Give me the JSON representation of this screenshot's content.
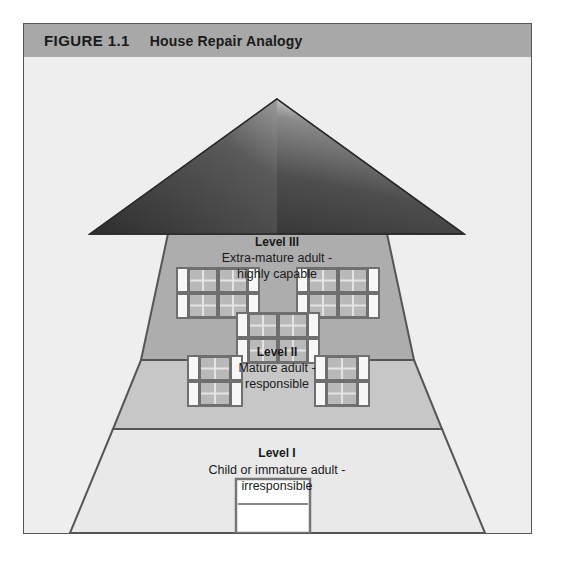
{
  "figure": {
    "number": "FIGURE 1.1",
    "title": "House Repair Analogy"
  },
  "diagram": {
    "name": "house-diagram",
    "levels": [
      {
        "id": "level-3",
        "title": "Level III",
        "desc_line1": "Extra-mature adult -",
        "desc_line2": "highly capable",
        "fill": "#a9a9a9"
      },
      {
        "id": "level-2",
        "title": "Level II",
        "desc_line1": "Mature adult -",
        "desc_line2": "responsible",
        "fill": "#c3c3c3"
      },
      {
        "id": "level-1",
        "title": "Level I",
        "desc_line1": "Child or immature adult -",
        "desc_line2": "irresponsible",
        "fill": "#e6e6e6"
      }
    ],
    "roof": {
      "name": "roof",
      "fill_light": "#8f8f8f",
      "fill_dark": "#2f2f2f"
    },
    "door": {
      "name": "front-door",
      "fill": "#ffffff"
    }
  },
  "colors": {
    "panel_bg": "#eeeeee",
    "header_bg": "#a8a8a8",
    "outline": "#555555",
    "window_frame": "#6f6f6f",
    "window_pane": "#b9b9b9",
    "shutter": "#f5f5f5"
  }
}
